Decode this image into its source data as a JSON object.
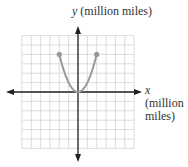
{
  "chart_data": {
    "type": "line",
    "title": "",
    "xlabel": "x (million miles)",
    "ylabel": "y (million miles)",
    "xlim": [
      -6,
      6
    ],
    "ylim": [
      -6,
      6
    ],
    "grid": true,
    "grid_step": 1,
    "tick_labels": false,
    "legend": null,
    "series": [
      {
        "name": "parabola",
        "equation": "y = x^2",
        "x": [
          -2,
          -1.5,
          -1,
          -0.5,
          0,
          0.5,
          1,
          1.5,
          2
        ],
        "y": [
          4,
          2.25,
          1,
          0.25,
          0,
          0.25,
          1,
          2.25,
          4
        ],
        "endpoints": [
          [
            -2,
            4
          ],
          [
            2,
            4
          ]
        ],
        "color": "#999999"
      }
    ]
  },
  "labels": {
    "y_var": "y",
    "y_unit": "(million miles)",
    "x_var": "x",
    "x_unit_line1": "(million",
    "x_unit_line2": "miles)"
  },
  "colors": {
    "grid": "#d4d4d4",
    "axis": "#222222",
    "curve": "#999999"
  }
}
